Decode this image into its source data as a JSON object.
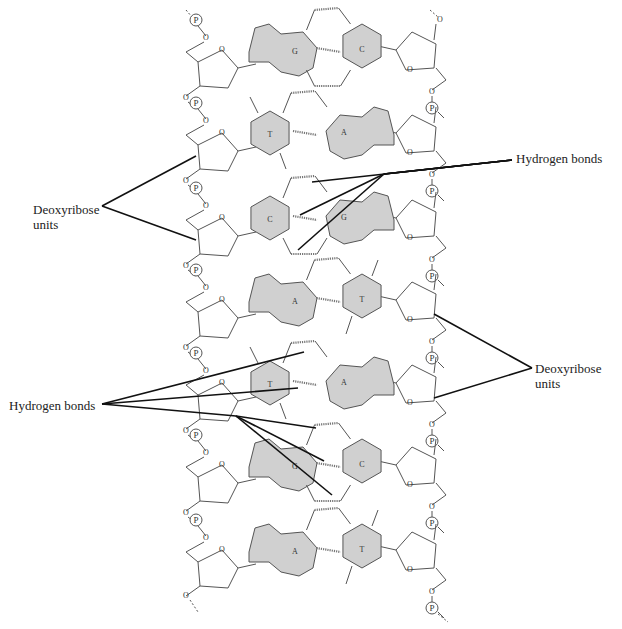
{
  "diagram": {
    "colors": {
      "base_fill": "#d0d0d0",
      "line": "#555555",
      "leader": "#111111"
    },
    "labels": {
      "hydrogen_bonds_right": "Hydrogen bonds",
      "deoxyribose_left_line1": "Deoxyribose",
      "deoxyribose_left_line2": "units",
      "deoxyribose_right_line1": "Deoxyribose",
      "deoxyribose_right_line2": "units",
      "hydrogen_bonds_left": "Hydrogen bonds"
    },
    "base_pairs": [
      {
        "left": "G",
        "right": "C"
      },
      {
        "left": "T",
        "right": "A"
      },
      {
        "left": "C",
        "right": "G"
      },
      {
        "left": "A",
        "right": "T"
      },
      {
        "left": "T",
        "right": "A"
      },
      {
        "left": "G",
        "right": "C"
      },
      {
        "left": "A",
        "right": "T"
      }
    ],
    "atom_labels": {
      "phosphate": "P",
      "oxygen": "O"
    }
  }
}
